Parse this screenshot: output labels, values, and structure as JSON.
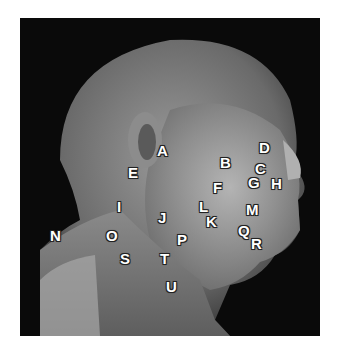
{
  "image": {
    "subject": "lateral dissection of head and neck",
    "tone": "grayscale"
  },
  "labels": [
    {
      "id": "A",
      "text": "A",
      "x": 162,
      "y": 151
    },
    {
      "id": "B",
      "text": "B",
      "x": 225,
      "y": 163
    },
    {
      "id": "C",
      "text": "C",
      "x": 260,
      "y": 169
    },
    {
      "id": "D",
      "text": "D",
      "x": 264,
      "y": 148
    },
    {
      "id": "E",
      "text": "E",
      "x": 133,
      "y": 173
    },
    {
      "id": "F",
      "text": "F",
      "x": 218,
      "y": 188
    },
    {
      "id": "G",
      "text": "G",
      "x": 253,
      "y": 183
    },
    {
      "id": "H",
      "text": "H",
      "x": 276,
      "y": 184
    },
    {
      "id": "I",
      "text": "I",
      "x": 122,
      "y": 207
    },
    {
      "id": "J",
      "text": "J",
      "x": 163,
      "y": 218
    },
    {
      "id": "K",
      "text": "K",
      "x": 211,
      "y": 222
    },
    {
      "id": "L",
      "text": "L",
      "x": 204,
      "y": 207
    },
    {
      "id": "M",
      "text": "M",
      "x": 251,
      "y": 210
    },
    {
      "id": "N",
      "text": "N",
      "x": 55,
      "y": 236
    },
    {
      "id": "O",
      "text": "O",
      "x": 111,
      "y": 236
    },
    {
      "id": "P",
      "text": "P",
      "x": 182,
      "y": 240
    },
    {
      "id": "Q",
      "text": "Q",
      "x": 243,
      "y": 231
    },
    {
      "id": "R",
      "text": "R",
      "x": 256,
      "y": 244
    },
    {
      "id": "S",
      "text": "S",
      "x": 125,
      "y": 259
    },
    {
      "id": "T",
      "text": "T",
      "x": 165,
      "y": 259
    },
    {
      "id": "U",
      "text": "U",
      "x": 171,
      "y": 287
    }
  ]
}
